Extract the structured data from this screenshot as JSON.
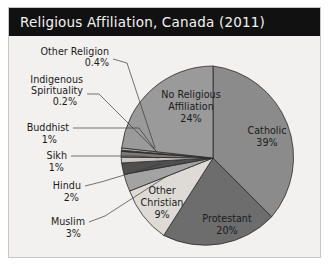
{
  "title": "Religious Affiliation, Canada (2011)",
  "chart_data": {
    "type": "pie",
    "title": "Religious Affiliation, Canada (2011)",
    "xlabel": "",
    "ylabel": "",
    "units": "percent",
    "legend": "none",
    "labels_position": "on-slice-and-callout",
    "categories": [
      "Catholic",
      "Protestant",
      "Other Christian",
      "Muslim",
      "Hindu",
      "Sikh",
      "Buddhist",
      "Indigenous Spirituality",
      "Other Religion",
      "No Religious Affiliation"
    ],
    "values": [
      39,
      20,
      9,
      3,
      2,
      1,
      1,
      0.2,
      0.4,
      24
    ],
    "slices": [
      {
        "name": "Catholic",
        "label": "Catholic",
        "value_label": "39%",
        "value": 39,
        "color": "#8b8b8b",
        "label_placement": "inside"
      },
      {
        "name": "Protestant",
        "label": "Protestant",
        "value_label": "20%",
        "value": 20,
        "color": "#6d6d6d",
        "label_placement": "inside"
      },
      {
        "name": "Other Christian",
        "label": "Other Christian",
        "value_label": "9%",
        "value": 9,
        "color": "#dedbd6",
        "label_placement": "inside"
      },
      {
        "name": "Muslim",
        "label": "Muslim",
        "value_label": "3%",
        "value": 3,
        "color": "#a3a3a3",
        "label_placement": "callout"
      },
      {
        "name": "Hindu",
        "label": "Hindu",
        "value_label": "2%",
        "value": 2,
        "color": "#4f4f4f",
        "label_placement": "callout"
      },
      {
        "name": "Sikh",
        "label": "Sikh",
        "value_label": "1%",
        "value": 1,
        "color": "#c9c7c2",
        "label_placement": "callout"
      },
      {
        "name": "Buddhist",
        "label": "Buddhist",
        "value_label": "1%",
        "value": 1,
        "color": "#7a7a7a",
        "label_placement": "callout"
      },
      {
        "name": "Indigenous Spirituality",
        "label": "Indigenous Spirituality",
        "label_line1": "Indigenous",
        "label_line2": "Spirituality",
        "value_label": "0.2%",
        "value": 0.2,
        "color": "#2e2e2e",
        "label_placement": "callout"
      },
      {
        "name": "Other Religion",
        "label": "Other Religion",
        "value_label": "0.4%",
        "value": 0.4,
        "color": "#b5b3ae",
        "label_placement": "callout"
      },
      {
        "name": "No Religious Affiliation",
        "label": "No Religious Affiliation",
        "label_line1": "No Religious",
        "label_line2": "Affiliation",
        "value_label": "24%",
        "value": 24,
        "color": "#9a9a9a",
        "label_placement": "inside"
      }
    ]
  }
}
